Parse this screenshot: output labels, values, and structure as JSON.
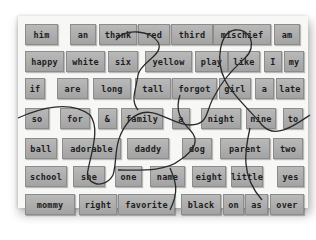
{
  "scene": "Refrigerator-style word magnet tiles on a white board, overlaid with jigsaw puzzle cut lines",
  "tiles": [
    {
      "word": "him",
      "x": 25,
      "y": 24,
      "w": 31
    },
    {
      "word": "an",
      "x": 70,
      "y": 24,
      "w": 24
    },
    {
      "word": "thank",
      "x": 99,
      "y": 24,
      "w": 36
    },
    {
      "word": "red",
      "x": 138,
      "y": 24,
      "w": 30
    },
    {
      "word": "third",
      "x": 171,
      "y": 24,
      "w": 40
    },
    {
      "word": "mischief",
      "x": 213,
      "y": 24,
      "w": 56
    },
    {
      "word": "am",
      "x": 274,
      "y": 24,
      "w": 24
    },
    {
      "word": "happy",
      "x": 25,
      "y": 51,
      "w": 37
    },
    {
      "word": "white",
      "x": 66,
      "y": 51,
      "w": 37
    },
    {
      "word": "six",
      "x": 108,
      "y": 51,
      "w": 28
    },
    {
      "word": "yellow",
      "x": 145,
      "y": 51,
      "w": 45
    },
    {
      "word": "play",
      "x": 195,
      "y": 51,
      "w": 31
    },
    {
      "word": "like",
      "x": 228,
      "y": 51,
      "w": 30
    },
    {
      "word": "I",
      "x": 264,
      "y": 51,
      "w": 16
    },
    {
      "word": "my",
      "x": 284,
      "y": 51,
      "w": 18
    },
    {
      "word": "if",
      "x": 25,
      "y": 78,
      "w": 18
    },
    {
      "word": "are",
      "x": 57,
      "y": 78,
      "w": 29
    },
    {
      "word": "long",
      "x": 93,
      "y": 78,
      "w": 36
    },
    {
      "word": "tall",
      "x": 135,
      "y": 78,
      "w": 34
    },
    {
      "word": "forgot",
      "x": 172,
      "y": 78,
      "w": 43
    },
    {
      "word": "girl",
      "x": 219,
      "y": 78,
      "w": 30
    },
    {
      "word": "a",
      "x": 255,
      "y": 78,
      "w": 17
    },
    {
      "word": "late",
      "x": 276,
      "y": 78,
      "w": 26
    },
    {
      "word": "so",
      "x": 25,
      "y": 108,
      "w": 22
    },
    {
      "word": "for",
      "x": 60,
      "y": 108,
      "w": 28
    },
    {
      "word": "&",
      "x": 98,
      "y": 108,
      "w": 17
    },
    {
      "word": "family",
      "x": 121,
      "y": 108,
      "w": 40
    },
    {
      "word": "a",
      "x": 172,
      "y": 108,
      "w": 16
    },
    {
      "word": "night",
      "x": 201,
      "y": 108,
      "w": 38
    },
    {
      "word": "nine",
      "x": 246,
      "y": 108,
      "w": 28
    },
    {
      "word": "to",
      "x": 283,
      "y": 108,
      "w": 18
    },
    {
      "word": "ball",
      "x": 25,
      "y": 138,
      "w": 30
    },
    {
      "word": "adorable",
      "x": 62,
      "y": 138,
      "w": 57
    },
    {
      "word": "daddy",
      "x": 127,
      "y": 138,
      "w": 40
    },
    {
      "word": "dog",
      "x": 182,
      "y": 138,
      "w": 28
    },
    {
      "word": "parent",
      "x": 220,
      "y": 138,
      "w": 48
    },
    {
      "word": "two",
      "x": 273,
      "y": 138,
      "w": 28
    },
    {
      "word": "school",
      "x": 25,
      "y": 166,
      "w": 40
    },
    {
      "word": "she",
      "x": 73,
      "y": 166,
      "w": 30
    },
    {
      "word": "one",
      "x": 115,
      "y": 166,
      "w": 25
    },
    {
      "word": "name",
      "x": 150,
      "y": 166,
      "w": 33
    },
    {
      "word": "eight",
      "x": 192,
      "y": 166,
      "w": 32
    },
    {
      "word": "little",
      "x": 231,
      "y": 166,
      "w": 30
    },
    {
      "word": "yes",
      "x": 277,
      "y": 166,
      "w": 25
    },
    {
      "word": "mommy",
      "x": 25,
      "y": 194,
      "w": 48
    },
    {
      "word": "right",
      "x": 79,
      "y": 194,
      "w": 36
    },
    {
      "word": "favorite",
      "x": 118,
      "y": 194,
      "w": 55
    },
    {
      "word": "black",
      "x": 181,
      "y": 194,
      "w": 38
    },
    {
      "word": "on",
      "x": 223,
      "y": 194,
      "w": 19
    },
    {
      "word": "as",
      "x": 245,
      "y": 194,
      "w": 21
    },
    {
      "word": "over",
      "x": 270,
      "y": 194,
      "w": 32
    }
  ],
  "colors": {
    "board": "#f7f7f6",
    "tile": "#ababab",
    "text": "#1d1d1d",
    "cut_line": "#2a2a2a"
  }
}
